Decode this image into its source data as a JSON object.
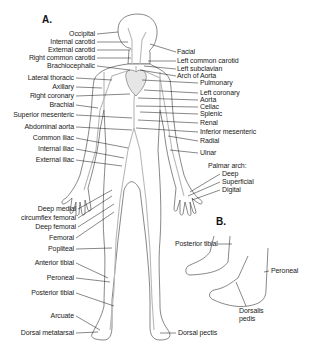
{
  "panels": {
    "a": "A.",
    "b": "B."
  },
  "labels_left": [
    {
      "text": "Occipital",
      "y": 30
    },
    {
      "text": "Internal carotid",
      "y": 38
    },
    {
      "text": "External carotid",
      "y": 46
    },
    {
      "text": "Right common carotid",
      "y": 54
    },
    {
      "text": "Brachiocephalic",
      "y": 62
    },
    {
      "text": "Lateral thoracic",
      "y": 74
    },
    {
      "text": "Axillary",
      "y": 83
    },
    {
      "text": "Right coronary",
      "y": 92
    },
    {
      "text": "Brachial",
      "y": 101
    },
    {
      "text": "Superior mesenteric",
      "y": 111
    },
    {
      "text": "Abdominal aorta",
      "y": 123
    },
    {
      "text": "Common iliac",
      "y": 134
    },
    {
      "text": "Internal iliac",
      "y": 145
    },
    {
      "text": "External iliac",
      "y": 156
    },
    {
      "text": "Deep medial",
      "y": 205
    },
    {
      "text": "circumflex femoral",
      "y": 214
    },
    {
      "text": "Deep femoral",
      "y": 223
    },
    {
      "text": "Femoral",
      "y": 234
    },
    {
      "text": "Popliteal",
      "y": 245
    },
    {
      "text": "Anterior tibial",
      "y": 259
    },
    {
      "text": "Peroneal",
      "y": 274
    },
    {
      "text": "Posterior tibial",
      "y": 289
    },
    {
      "text": "Arcuate",
      "y": 312
    },
    {
      "text": "Dorsal metatarsal",
      "y": 329
    }
  ],
  "labels_right": [
    {
      "text": "Facial",
      "y": 48,
      "x": 177
    },
    {
      "text": "Left common carotid",
      "y": 57,
      "x": 177
    },
    {
      "text": "Left subclavian",
      "y": 65,
      "x": 177
    },
    {
      "text": "Arch of Aorta",
      "y": 72,
      "x": 177
    },
    {
      "text": "Pulmonary",
      "y": 79,
      "x": 200
    },
    {
      "text": "Left coronary",
      "y": 89,
      "x": 200
    },
    {
      "text": "Aorta",
      "y": 96,
      "x": 200
    },
    {
      "text": "Celiac",
      "y": 103,
      "x": 200
    },
    {
      "text": "Splenic",
      "y": 110,
      "x": 200
    },
    {
      "text": "Renal",
      "y": 119,
      "x": 200
    },
    {
      "text": "Inferior mesenteric",
      "y": 128,
      "x": 200
    },
    {
      "text": "Radial",
      "y": 137,
      "x": 200
    },
    {
      "text": "Ulnar",
      "y": 149,
      "x": 200
    },
    {
      "text": "Palmar arch:",
      "y": 162,
      "x": 208
    },
    {
      "text": "Deep",
      "y": 170,
      "x": 222
    },
    {
      "text": "Superficial",
      "y": 178,
      "x": 222
    },
    {
      "text": "Digital",
      "y": 186,
      "x": 222
    }
  ],
  "labels_b": [
    {
      "text": "Posterior tibial",
      "y": 240,
      "x": 175
    },
    {
      "text": "Peroneal",
      "y": 267,
      "x": 271
    },
    {
      "text": "Dorsalis",
      "y": 307,
      "x": 239
    },
    {
      "text": "pedis",
      "y": 315,
      "x": 239
    },
    {
      "text": "Dorsal pectis",
      "y": 329,
      "x": 178
    }
  ]
}
